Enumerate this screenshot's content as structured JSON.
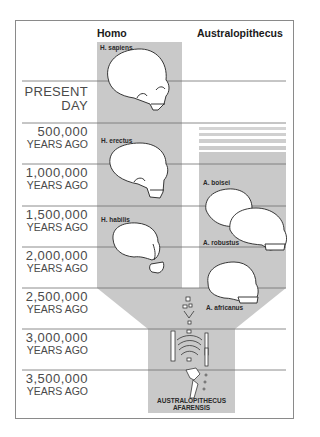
{
  "columns": {
    "homo": "Homo",
    "australopithecus": "Australopithecus"
  },
  "timeline": [
    {
      "value": "PRESENT",
      "unit": "DAY"
    },
    {
      "value": "500,000",
      "unit": "YEARS AGO"
    },
    {
      "value": "1,000,000",
      "unit": "YEARS AGO"
    },
    {
      "value": "1,500,000",
      "unit": "YEARS AGO"
    },
    {
      "value": "2,000,000",
      "unit": "YEARS AGO"
    },
    {
      "value": "2,500,000",
      "unit": "YEARS AGO"
    },
    {
      "value": "3,000,000",
      "unit": "YEARS AGO"
    },
    {
      "value": "3,500,000",
      "unit": "YEARS AGO"
    }
  ],
  "species": {
    "h_sapiens": "H. sapiens",
    "h_erectus": "H. erectus",
    "h_habilis": "H. habilis",
    "a_boisei": "A. boisei",
    "a_robustus": "A. robustus",
    "a_africanus": "A. africanus",
    "a_afarensis_line1": "AUSTRALOPITHECUS",
    "a_afarensis_line2": "AFARENSIS"
  },
  "colors": {
    "column_fill": "#c9c9c9",
    "rule": "#6e6e6e",
    "text": "#4a4a4a"
  }
}
